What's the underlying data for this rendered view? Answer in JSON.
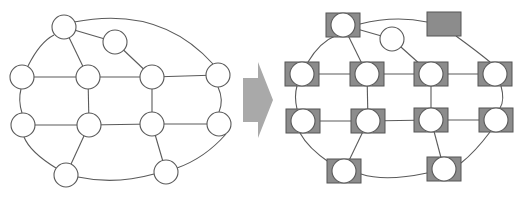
{
  "diagram": {
    "title": "",
    "colors": {
      "background": "#ffffff",
      "stroke": "#5a5a5a",
      "node_fill": "#ffffff",
      "device_fill": "#8c8c8c",
      "device_stroke": "#555555",
      "arrow_fill": "#a9a9a9"
    },
    "left_graph": {
      "label": "graph-before",
      "nodes": [
        {
          "id": "a",
          "x": 64,
          "y": 27
        },
        {
          "id": "b",
          "x": 115,
          "y": 42
        },
        {
          "id": "c",
          "x": 22,
          "y": 77
        },
        {
          "id": "d",
          "x": 88,
          "y": 77
        },
        {
          "id": "e",
          "x": 152,
          "y": 77
        },
        {
          "id": "f",
          "x": 218,
          "y": 75
        },
        {
          "id": "g",
          "x": 23,
          "y": 125
        },
        {
          "id": "h",
          "x": 89,
          "y": 125
        },
        {
          "id": "i",
          "x": 152,
          "y": 124
        },
        {
          "id": "j",
          "x": 219,
          "y": 124
        },
        {
          "id": "k",
          "x": 66,
          "y": 175
        },
        {
          "id": "l",
          "x": 166,
          "y": 172
        }
      ],
      "radius": 12,
      "edges": [
        [
          "a",
          "b"
        ],
        [
          "a",
          "d"
        ],
        [
          "b",
          "e"
        ],
        [
          "c",
          "d"
        ],
        [
          "d",
          "e"
        ],
        [
          "e",
          "f"
        ],
        [
          "d",
          "h"
        ],
        [
          "e",
          "i"
        ],
        [
          "g",
          "h"
        ],
        [
          "h",
          "i"
        ],
        [
          "i",
          "j"
        ],
        [
          "h",
          "k"
        ],
        [
          "i",
          "l"
        ]
      ],
      "ring_arcs": [
        "M74,22 Q160,5 213,64",
        "M218,87 Q224,100 219,112",
        "M226,134 Q205,158 177,168",
        "M154,174 Q115,185 78,177",
        "M56,168 Q30,152 24,137",
        "M22,113 Q18,100 21,89",
        "M28,66 Q40,42 54,35"
      ]
    },
    "arrow": {
      "label": "transform-arrow",
      "points": "243,78 258,78 258,62 273,100 258,138 258,122 243,122"
    },
    "right_graph": {
      "label": "graph-after",
      "nodes": [
        {
          "id": "a",
          "x": 343,
          "y": 25,
          "device": true
        },
        {
          "id": "b",
          "x": 392,
          "y": 39,
          "device": false
        },
        {
          "id": "c",
          "x": 302,
          "y": 74,
          "device": true
        },
        {
          "id": "d",
          "x": 367,
          "y": 74,
          "device": true
        },
        {
          "id": "e",
          "x": 431,
          "y": 74,
          "device": true
        },
        {
          "id": "f",
          "x": 495,
          "y": 74,
          "device": true
        },
        {
          "id": "g",
          "x": 303,
          "y": 121,
          "device": true
        },
        {
          "id": "h",
          "x": 368,
          "y": 121,
          "device": true
        },
        {
          "id": "i",
          "x": 431,
          "y": 120,
          "device": true
        },
        {
          "id": "j",
          "x": 496,
          "y": 120,
          "device": true
        },
        {
          "id": "k",
          "x": 344,
          "y": 171,
          "device": true
        },
        {
          "id": "l",
          "x": 444,
          "y": 169,
          "device": true
        }
      ],
      "standalone_box": {
        "x": 427,
        "y": 12,
        "w": 34,
        "h": 24
      },
      "radius": 12,
      "box": {
        "w": 34,
        "h": 24
      },
      "edges": [
        [
          "a",
          "b"
        ],
        [
          "a",
          "d"
        ],
        [
          "b",
          "e"
        ],
        [
          "c",
          "d"
        ],
        [
          "d",
          "e"
        ],
        [
          "e",
          "f"
        ],
        [
          "d",
          "h"
        ],
        [
          "e",
          "i"
        ],
        [
          "g",
          "h"
        ],
        [
          "h",
          "i"
        ],
        [
          "i",
          "j"
        ],
        [
          "h",
          "k"
        ],
        [
          "i",
          "l"
        ]
      ],
      "ring_arcs": [
        "M360,24 Q395,15 427,22",
        "M456,36 Q478,52 490,62",
        "M501,86 Q505,100 500,108",
        "M490,132 Q475,152 461,163",
        "M427,173 Q385,182 361,174",
        "M330,163 Q308,148 300,133",
        "M297,109 Q294,96 297,86",
        "M308,62 Q320,42 335,36"
      ]
    }
  }
}
